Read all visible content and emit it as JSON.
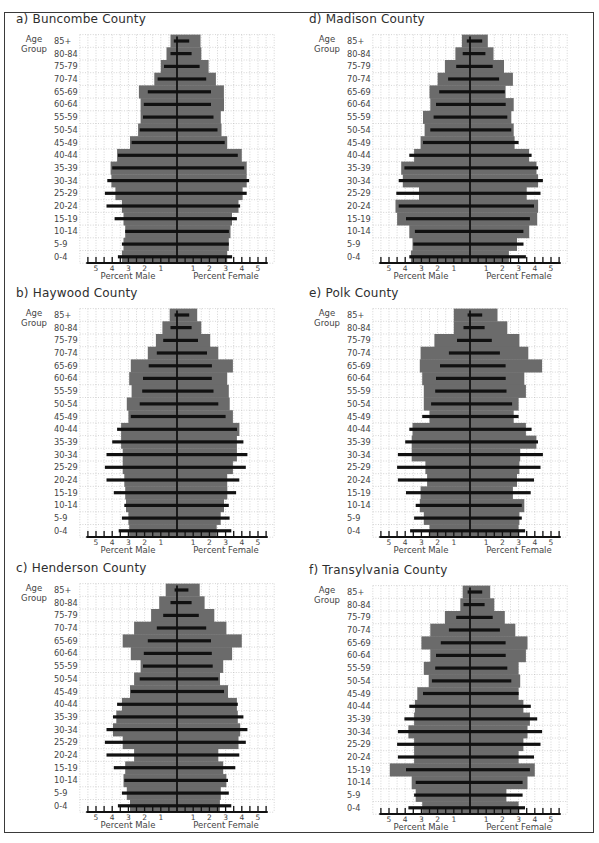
{
  "chart_data": [
    {
      "type": "bar",
      "orientation": "horizontal-population-pyramid",
      "title": "a) Buncombe County",
      "ylabel": "Age Group",
      "xlabel_left": "Percent Male",
      "xlabel_right": "Percent Female",
      "x_tick_labels_left": [
        5,
        4,
        3,
        2,
        1
      ],
      "x_tick_labels_right": [
        1,
        2,
        3,
        4,
        5
      ],
      "xlim": [
        -6,
        6
      ],
      "grid": true,
      "categories": [
        "85+",
        "80-84",
        "75-79",
        "70-74",
        "65-69",
        "60-64",
        "55-59",
        "50-54",
        "45-49",
        "40-44",
        "35-39",
        "30-34",
        "25-29",
        "20-24",
        "15-19",
        "10-14",
        "5-9",
        "0-4"
      ],
      "series": [
        {
          "name": "shaded_male",
          "values": [
            0.4,
            0.65,
            1.0,
            1.4,
            2.35,
            2.25,
            2.25,
            2.4,
            2.9,
            3.7,
            4.1,
            4.05,
            3.8,
            3.4,
            3.3,
            3.2,
            3.3,
            3.4
          ]
        },
        {
          "name": "shaded_female",
          "values": [
            1.45,
            1.5,
            1.95,
            2.4,
            2.9,
            2.9,
            2.7,
            2.75,
            3.1,
            4.0,
            4.3,
            4.3,
            4.05,
            3.8,
            3.4,
            3.3,
            3.2,
            3.1
          ]
        },
        {
          "name": "black_bar_male",
          "values": [
            0.2,
            0.4,
            0.8,
            1.2,
            1.8,
            2.05,
            2.1,
            2.3,
            2.8,
            3.65,
            4.0,
            4.3,
            4.45,
            4.35,
            3.85,
            3.2,
            3.4,
            3.65
          ]
        },
        {
          "name": "black_bar_female",
          "values": [
            0.75,
            0.9,
            1.4,
            1.8,
            2.1,
            2.1,
            2.25,
            2.5,
            2.95,
            3.75,
            4.15,
            4.45,
            4.3,
            3.9,
            3.7,
            3.2,
            3.2,
            3.4
          ]
        }
      ]
    },
    {
      "type": "bar",
      "orientation": "horizontal-population-pyramid",
      "title": "b) Haywood County",
      "ylabel": "Age Group",
      "xlabel_left": "Percent Male",
      "xlabel_right": "Percent Female",
      "x_tick_labels_left": [
        5,
        4,
        3,
        2,
        1
      ],
      "x_tick_labels_right": [
        1,
        2,
        3,
        4,
        5
      ],
      "xlim": [
        -6,
        6
      ],
      "grid": true,
      "categories": [
        "85+",
        "80-84",
        "75-79",
        "70-74",
        "65-69",
        "60-64",
        "55-59",
        "50-54",
        "45-49",
        "40-44",
        "35-39",
        "30-34",
        "25-29",
        "20-24",
        "15-19",
        "10-14",
        "5-9",
        "0-4"
      ],
      "series": [
        {
          "name": "shaded_male",
          "values": [
            0.45,
            0.9,
            1.3,
            1.8,
            2.85,
            2.95,
            2.8,
            3.1,
            3.0,
            3.45,
            3.45,
            3.35,
            3.35,
            3.25,
            3.2,
            3.15,
            3.0,
            2.95
          ]
        },
        {
          "name": "shaded_female",
          "values": [
            1.25,
            1.5,
            2.05,
            2.55,
            3.45,
            3.1,
            3.2,
            3.25,
            3.45,
            3.85,
            3.7,
            3.7,
            3.45,
            3.1,
            3.1,
            2.9,
            2.7,
            2.45
          ]
        },
        {
          "name": "black_bar_male",
          "values": [
            0.15,
            0.4,
            0.85,
            1.25,
            1.75,
            2.1,
            2.15,
            2.3,
            2.85,
            3.7,
            4.0,
            4.35,
            4.45,
            4.35,
            3.9,
            3.25,
            3.4,
            3.6
          ]
        },
        {
          "name": "black_bar_female",
          "values": [
            0.75,
            0.9,
            1.3,
            1.85,
            2.15,
            2.15,
            2.25,
            2.55,
            3.0,
            3.7,
            4.1,
            4.35,
            4.25,
            3.85,
            3.65,
            3.2,
            3.25,
            3.35
          ]
        }
      ]
    },
    {
      "type": "bar",
      "orientation": "horizontal-population-pyramid",
      "title": "c) Henderson County",
      "ylabel": "Age Group",
      "xlabel_left": "Percent Male",
      "xlabel_right": "Percent Female",
      "x_tick_labels_left": [
        5,
        4,
        3,
        2,
        1
      ],
      "x_tick_labels_right": [
        1,
        2,
        3,
        4,
        5
      ],
      "xlim": [
        -6,
        6
      ],
      "grid": true,
      "categories": [
        "85+",
        "80-84",
        "75-79",
        "70-74",
        "65-69",
        "60-64",
        "55-59",
        "50-54",
        "45-49",
        "40-44",
        "35-39",
        "30-34",
        "25-29",
        "20-24",
        "15-19",
        "10-14",
        "5-9",
        "0-4"
      ],
      "series": [
        {
          "name": "shaded_male",
          "values": [
            0.7,
            1.1,
            1.6,
            2.65,
            3.35,
            2.85,
            2.25,
            2.65,
            2.9,
            3.4,
            3.75,
            3.95,
            3.35,
            2.65,
            3.2,
            3.3,
            3.1,
            2.9
          ]
        },
        {
          "name": "shaded_female",
          "values": [
            1.4,
            1.7,
            2.3,
            3.05,
            4.0,
            3.4,
            2.85,
            2.65,
            3.15,
            3.7,
            3.75,
            3.9,
            3.8,
            2.55,
            2.85,
            3.05,
            2.7,
            2.65
          ]
        },
        {
          "name": "black_bar_male",
          "values": [
            0.15,
            0.4,
            0.85,
            1.25,
            1.8,
            2.05,
            2.1,
            2.3,
            2.85,
            3.7,
            3.95,
            4.35,
            4.45,
            4.35,
            3.9,
            3.25,
            3.4,
            3.65
          ]
        },
        {
          "name": "black_bar_female",
          "values": [
            0.7,
            0.9,
            1.35,
            1.8,
            2.1,
            2.15,
            2.2,
            2.55,
            2.9,
            3.75,
            4.1,
            4.35,
            4.25,
            3.85,
            3.6,
            3.15,
            3.2,
            3.35
          ]
        }
      ]
    },
    {
      "type": "bar",
      "orientation": "horizontal-population-pyramid",
      "title": "d) Madison County",
      "ylabel": "Age Group",
      "xlabel_left": "Percent Male",
      "xlabel_right": "Percent Female",
      "x_tick_labels_left": [
        5,
        4,
        3,
        2,
        1
      ],
      "x_tick_labels_right": [
        1,
        2,
        3,
        4,
        5
      ],
      "xlim": [
        -6,
        6
      ],
      "grid": true,
      "categories": [
        "85+",
        "80-84",
        "75-79",
        "70-74",
        "65-69",
        "60-64",
        "55-59",
        "50-54",
        "45-49",
        "40-44",
        "35-39",
        "30-34",
        "25-29",
        "20-24",
        "15-19",
        "10-14",
        "5-9",
        "0-4"
      ],
      "series": [
        {
          "name": "shaded_male",
          "values": [
            0.5,
            0.9,
            1.55,
            2.0,
            2.5,
            2.45,
            2.9,
            2.8,
            3.05,
            3.45,
            4.25,
            4.15,
            3.15,
            4.6,
            4.5,
            3.75,
            3.55,
            3.65
          ]
        },
        {
          "name": "shaded_female",
          "values": [
            1.1,
            1.45,
            2.1,
            2.65,
            2.2,
            2.7,
            2.55,
            2.7,
            2.75,
            3.65,
            4.1,
            4.2,
            3.5,
            4.2,
            4.15,
            3.65,
            2.9,
            2.4
          ]
        },
        {
          "name": "black_bar_male",
          "values": [
            0.2,
            0.45,
            0.85,
            1.35,
            1.9,
            2.1,
            2.25,
            2.45,
            2.9,
            3.75,
            4.05,
            4.4,
            4.55,
            4.4,
            3.95,
            3.4,
            3.5,
            3.75
          ]
        },
        {
          "name": "black_bar_female",
          "values": [
            0.75,
            0.95,
            1.4,
            1.8,
            2.15,
            2.2,
            2.3,
            2.55,
            3.0,
            3.8,
            4.2,
            4.5,
            4.35,
            3.95,
            3.7,
            3.3,
            3.3,
            3.45
          ]
        }
      ]
    },
    {
      "type": "bar",
      "orientation": "horizontal-population-pyramid",
      "title": "e) Polk County",
      "ylabel": "Age Group",
      "xlabel_left": "Percent Male",
      "xlabel_right": "Percent Female",
      "x_tick_labels_left": [
        5,
        4,
        3,
        2,
        1
      ],
      "x_tick_labels_right": [
        1,
        2,
        3,
        4,
        5
      ],
      "xlim": [
        -6,
        6
      ],
      "grid": true,
      "categories": [
        "85+",
        "80-84",
        "75-79",
        "70-74",
        "65-69",
        "60-64",
        "55-59",
        "50-54",
        "45-49",
        "40-44",
        "35-39",
        "30-34",
        "25-29",
        "20-24",
        "15-19",
        "10-14",
        "5-9",
        "0-4"
      ],
      "series": [
        {
          "name": "shaded_male",
          "values": [
            1.0,
            1.0,
            2.2,
            3.05,
            3.1,
            2.95,
            2.85,
            2.85,
            2.5,
            3.55,
            3.6,
            3.6,
            2.75,
            2.65,
            3.05,
            3.1,
            2.85,
            2.5
          ]
        },
        {
          "name": "shaded_female",
          "values": [
            1.7,
            2.3,
            3.05,
            3.6,
            4.45,
            3.35,
            3.45,
            3.0,
            2.7,
            3.45,
            4.1,
            3.1,
            3.05,
            2.9,
            2.65,
            3.35,
            3.05,
            3.0
          ]
        },
        {
          "name": "black_bar_male",
          "values": [
            0.15,
            0.4,
            0.8,
            1.3,
            1.85,
            2.1,
            2.15,
            2.4,
            2.95,
            3.75,
            4.0,
            4.45,
            4.5,
            4.45,
            3.95,
            3.35,
            3.45,
            3.7
          ]
        },
        {
          "name": "black_bar_female",
          "values": [
            0.75,
            0.9,
            1.35,
            1.85,
            2.2,
            2.2,
            2.25,
            2.6,
            3.0,
            3.8,
            4.2,
            4.5,
            4.35,
            3.95,
            3.75,
            3.2,
            3.2,
            3.4
          ]
        }
      ]
    },
    {
      "type": "bar",
      "orientation": "horizontal-population-pyramid",
      "title": "f) Transylvania County",
      "ylabel": "Age Group",
      "xlabel_left": "Percent Male",
      "xlabel_right": "Percent Female",
      "x_tick_labels_left": [
        5,
        4,
        3,
        2,
        1
      ],
      "x_tick_labels_right": [
        1,
        2,
        3,
        4,
        5
      ],
      "xlim": [
        -6,
        6
      ],
      "grid": true,
      "categories": [
        "85+",
        "80-84",
        "75-79",
        "70-74",
        "65-69",
        "60-64",
        "55-59",
        "50-54",
        "45-49",
        "40-44",
        "35-39",
        "30-34",
        "25-29",
        "20-24",
        "15-19",
        "10-14",
        "5-9",
        "0-4"
      ],
      "series": [
        {
          "name": "shaded_male",
          "values": [
            0.45,
            0.6,
            1.55,
            2.45,
            3.0,
            2.45,
            2.85,
            2.55,
            3.25,
            3.4,
            3.45,
            3.8,
            3.45,
            3.45,
            4.95,
            3.6,
            3.35,
            2.95
          ]
        },
        {
          "name": "shaded_female",
          "values": [
            1.25,
            1.5,
            2.15,
            2.8,
            3.55,
            3.45,
            3.0,
            3.1,
            3.0,
            3.3,
            3.7,
            3.55,
            3.3,
            3.0,
            4.0,
            3.55,
            2.25,
            3.0
          ]
        },
        {
          "name": "black_bar_male",
          "values": [
            0.15,
            0.4,
            0.85,
            1.3,
            1.8,
            2.1,
            2.15,
            2.35,
            2.9,
            3.75,
            4.05,
            4.45,
            4.5,
            4.45,
            3.95,
            3.35,
            3.45,
            3.8
          ]
        },
        {
          "name": "black_bar_female",
          "values": [
            0.75,
            0.9,
            1.4,
            1.85,
            2.2,
            2.2,
            2.3,
            2.55,
            3.0,
            3.75,
            4.15,
            4.45,
            4.35,
            3.95,
            3.7,
            3.25,
            3.25,
            3.4
          ]
        }
      ]
    }
  ],
  "colors": {
    "shaded": "#6b6b6b",
    "black_bar": "#111111",
    "grid": "#b9b9b9",
    "frame": "#3a3a3a"
  }
}
